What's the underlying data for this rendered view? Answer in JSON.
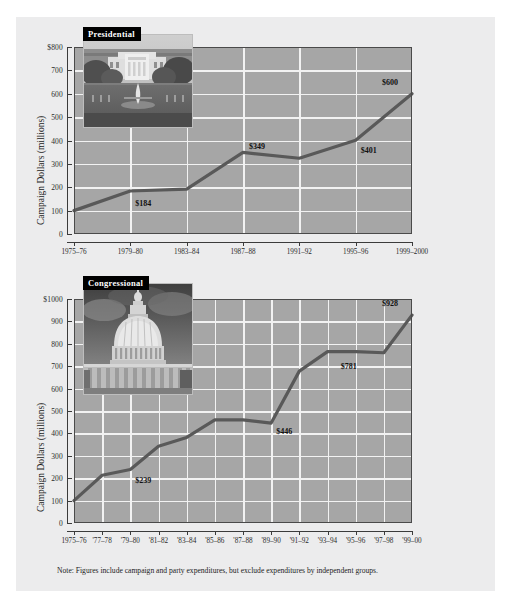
{
  "page": {
    "background_color": "#ffffff",
    "panel_color": "#ececed",
    "plot_background_color": "#a6a6a6",
    "gridline_color": "#f2f2f2",
    "line_color": "#595959",
    "note": "Note: Figures include campaign and party expenditures, but exclude expenditures by independent groups.",
    "note_prefix": "Note:"
  },
  "chart_data": [
    {
      "type": "line",
      "title": "Presidential",
      "inset_caption": "Presidential",
      "inset_image": "white-house-photo",
      "xlabel": "",
      "ylabel": "Campaign Dollars (millions)",
      "ylim": [
        0,
        800
      ],
      "ytick_labels": [
        "$800",
        "700",
        "600",
        "500",
        "400",
        "300",
        "200",
        "100",
        "0"
      ],
      "ytick_values": [
        800,
        700,
        600,
        500,
        400,
        300,
        200,
        100,
        0
      ],
      "grid": true,
      "legend": "none",
      "categories": [
        "1975–76",
        "1979–80",
        "1983–84",
        "1987–88",
        "1991–92",
        "1995–96",
        "1999–2000"
      ],
      "values": [
        100,
        184,
        192,
        349,
        324,
        401,
        600
      ],
      "point_labels": [
        {
          "index": 1,
          "text": "$184"
        },
        {
          "index": 3,
          "text": "$349"
        },
        {
          "index": 5,
          "text": "$401"
        },
        {
          "index": 6,
          "text": "$600"
        }
      ]
    },
    {
      "type": "line",
      "title": "Congressional",
      "inset_caption": "Congressional",
      "inset_image": "us-capitol-photo",
      "xlabel": "",
      "ylabel": "Campaign Dollars (millions)",
      "ylim": [
        0,
        1000
      ],
      "ytick_labels": [
        "$1000",
        "900",
        "800",
        "700",
        "600",
        "500",
        "400",
        "300",
        "200",
        "100",
        "0"
      ],
      "ytick_values": [
        1000,
        900,
        800,
        700,
        600,
        500,
        400,
        300,
        200,
        100,
        0
      ],
      "grid": true,
      "legend": "none",
      "categories": [
        "1975–76",
        "'77–78",
        "'79–80",
        "'81–82",
        "'83–84",
        "'85–86",
        "'87–88",
        "'89–90",
        "'91–92",
        "'93–94",
        "'95–96",
        "'97–98",
        "'99–00"
      ],
      "values": [
        100,
        213,
        239,
        343,
        382,
        460,
        460,
        446,
        678,
        765,
        765,
        760,
        928
      ],
      "point_labels": [
        {
          "index": 2,
          "text": "$239"
        },
        {
          "index": 7,
          "text": "$446"
        },
        {
          "index": 10,
          "text": "$781"
        },
        {
          "index": 12,
          "text": "$928"
        }
      ]
    }
  ]
}
